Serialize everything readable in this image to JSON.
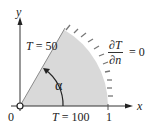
{
  "diagram": {
    "axes": {
      "x_label": "x",
      "y_label": "y",
      "origin_label": "0",
      "x_tick_label": "1"
    },
    "boundaries": {
      "top_edge": {
        "var": "T",
        "eq": "= 50"
      },
      "bottom_edge": {
        "var": "T",
        "eq": "= 100"
      },
      "arc": {
        "num": "∂T",
        "den": "∂n",
        "eq": "= 0"
      }
    },
    "angle_label": "α",
    "colors": {
      "region_fill": "#d9d9d9",
      "line": "#333333",
      "hatch": "#777777"
    }
  }
}
